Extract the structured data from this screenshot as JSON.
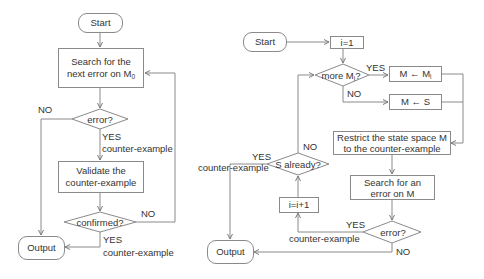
{
  "left_flowchart": {
    "start": "Start",
    "search": {
      "line1": "Search for the",
      "line2": "next error on M",
      "sub": "0"
    },
    "error_decision": "error?",
    "error_no": "NO",
    "error_yes": "YES",
    "error_yes_note": "counter-example",
    "validate": {
      "line1": "Validate the",
      "line2": "counter-example"
    },
    "confirmed_decision": "confirmed?",
    "confirmed_no": "NO",
    "confirmed_yes": "YES",
    "confirmed_yes_note": "counter-example",
    "output": "Output"
  },
  "right_flowchart": {
    "start": "Start",
    "init": "i=1",
    "more_decision": {
      "text": "more M",
      "sub": "i",
      "suffix": "?"
    },
    "more_yes": "YES",
    "more_no": "NO",
    "assign_mi": {
      "text": "M ← M",
      "sub": "i"
    },
    "assign_s": "M ← S",
    "restrict": {
      "line1": "Restrict the state space M",
      "line2": "to the counter-example"
    },
    "search": {
      "line1": "Search for an",
      "line2": "error on M"
    },
    "error_decision": "error?",
    "error_yes": "YES",
    "error_yes_note": "counter-example",
    "error_no": "NO",
    "increment": "i=i+1",
    "s_already_decision": "S already?",
    "s_already_no": "NO",
    "s_already_yes": "YES",
    "s_already_yes_note": "counter-example",
    "output": "Output"
  },
  "colors": {
    "stroke": "#8a8a8a",
    "text": "#333333",
    "background": "#ffffff"
  }
}
